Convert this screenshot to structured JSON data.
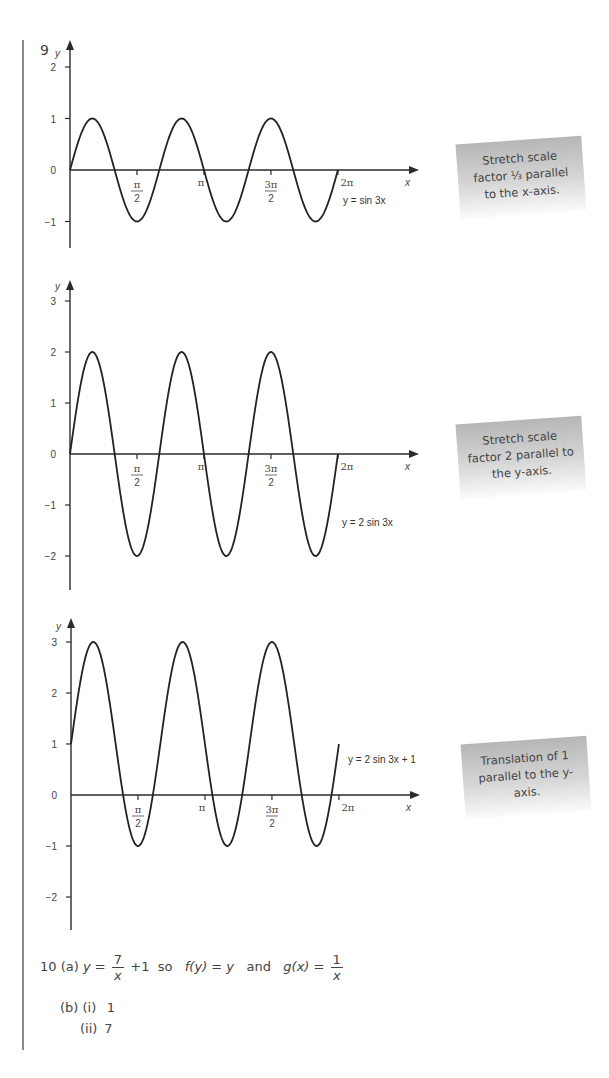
{
  "question9": {
    "number": "9",
    "graphs": [
      {
        "equation_label": "y = sin 3x",
        "y_ticks": [
          "2",
          "1",
          "0",
          "−1"
        ],
        "x_ticks": [
          "π/2",
          "π",
          "3π/2",
          "2π"
        ],
        "x_axis_label": "x",
        "y_axis_label": "y",
        "note": "Stretch scale factor ⅓ parallel to the x-axis."
      },
      {
        "equation_label": "y = 2 sin 3x",
        "y_ticks": [
          "3",
          "2",
          "1",
          "0",
          "−1",
          "−2"
        ],
        "x_ticks": [
          "π/2",
          "π",
          "3π/2",
          "2π"
        ],
        "x_axis_label": "x",
        "y_axis_label": "y",
        "note": "Stretch scale factor 2 parallel to the y-axis."
      },
      {
        "equation_label": "y = 2 sin 3x + 1",
        "y_ticks": [
          "3",
          "2",
          "1",
          "0",
          "−1",
          "−2"
        ],
        "x_ticks": [
          "π/2",
          "π",
          "3π/2",
          "2π"
        ],
        "x_axis_label": "x",
        "y_axis_label": "y",
        "note": "Translation of 1 parallel to the y-axis."
      }
    ]
  },
  "question10": {
    "number": "10",
    "part_a_label": "(a)",
    "part_a": {
      "lhs": "y =",
      "frac1_num": "7",
      "frac1_den": "x",
      "after_frac1": "+1  so  ",
      "f_expr": "f(y) = y",
      "and": "  and  ",
      "g_expr": "g(x) =",
      "frac2_num": "1",
      "frac2_den": "x"
    },
    "part_b_label": "(b)",
    "part_b": [
      {
        "label": "(i)",
        "value": "1"
      },
      {
        "label": "(ii)",
        "value": "7"
      }
    ]
  },
  "chart_data": [
    {
      "type": "line",
      "title": "y = sin 3x",
      "xlabel": "x",
      "ylabel": "y",
      "x_tick_labels": [
        "π/2",
        "π",
        "3π/2",
        "2π"
      ],
      "y_tick_labels": [
        "−1",
        "0",
        "1",
        "2"
      ],
      "xlim": [
        0,
        6.2832
      ],
      "ylim": [
        -1.5,
        2.5
      ],
      "function": "sin(3x)",
      "x": [
        0,
        0.5236,
        1.0472,
        1.5708,
        2.0944,
        2.618,
        3.1416,
        3.6652,
        4.1888,
        4.7124,
        5.236,
        5.7596,
        6.2832
      ],
      "values": [
        0,
        1,
        0,
        -1,
        0,
        1,
        0,
        -1,
        0,
        1,
        0,
        -1,
        0
      ],
      "annotation": "Stretch scale factor ⅓ parallel to the x-axis."
    },
    {
      "type": "line",
      "title": "y = 2 sin 3x",
      "xlabel": "x",
      "ylabel": "y",
      "x_tick_labels": [
        "π/2",
        "π",
        "3π/2",
        "2π"
      ],
      "y_tick_labels": [
        "−2",
        "−1",
        "0",
        "1",
        "2",
        "3"
      ],
      "xlim": [
        0,
        6.2832
      ],
      "ylim": [
        -2.7,
        3.5
      ],
      "function": "2*sin(3x)",
      "x": [
        0,
        0.5236,
        1.0472,
        1.5708,
        2.0944,
        2.618,
        3.1416,
        3.6652,
        4.1888,
        4.7124,
        5.236,
        5.7596,
        6.2832
      ],
      "values": [
        0,
        2,
        0,
        -2,
        0,
        2,
        0,
        -2,
        0,
        2,
        0,
        -2,
        0
      ],
      "annotation": "Stretch scale factor 2 parallel to the y-axis."
    },
    {
      "type": "line",
      "title": "y = 2 sin 3x + 1",
      "xlabel": "x",
      "ylabel": "y",
      "x_tick_labels": [
        "π/2",
        "π",
        "3π/2",
        "2π"
      ],
      "y_tick_labels": [
        "−2",
        "−1",
        "0",
        "1",
        "2",
        "3"
      ],
      "xlim": [
        0,
        6.2832
      ],
      "ylim": [
        -2.7,
        3.5
      ],
      "function": "2*sin(3x)+1",
      "x": [
        0,
        0.5236,
        1.0472,
        1.5708,
        2.0944,
        2.618,
        3.1416,
        3.6652,
        4.1888,
        4.7124,
        5.236,
        5.7596,
        6.2832
      ],
      "values": [
        1,
        3,
        1,
        -1,
        1,
        3,
        1,
        -1,
        1,
        3,
        1,
        -1,
        1
      ],
      "annotation": "Translation of 1 parallel to the y-axis."
    }
  ]
}
